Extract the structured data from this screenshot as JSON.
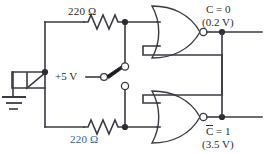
{
  "figure": {
    "background_color": "#ffffff",
    "line_color": "#3a3a42"
  },
  "labels": {
    "resistor_top": "220 Ω",
    "resistor_bottom": "220 Ω",
    "resistor_bottom_color": "#2f5fa8",
    "supply": "+5 V",
    "output_top_logic": "C = 0",
    "output_top_voltage": "(0.2 V)",
    "output_bottom_logic_base": "C",
    "output_bottom_logic_rest": " = 1",
    "output_bottom_voltage": "(3.5 V)"
  },
  "components": {
    "ground": "ground-symbol",
    "resistor_top": "resistor-zigzag",
    "resistor_bottom": "resistor-zigzag",
    "switch": "spdt-switch",
    "gate_top": "nor-gate",
    "gate_bottom": "nor-gate",
    "node_dots": 6
  }
}
